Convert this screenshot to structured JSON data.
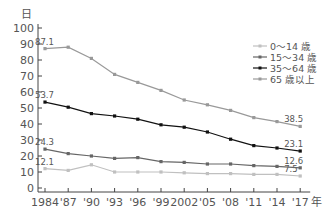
{
  "chart_data": {
    "type": "line",
    "title": "",
    "ylabel": "日",
    "xlabel": "年",
    "ylim": [
      0,
      100
    ],
    "yticks": [
      0,
      10,
      20,
      30,
      40,
      50,
      60,
      70,
      80,
      90,
      100
    ],
    "categories": [
      "1984",
      "'87",
      "'90",
      "'93",
      "'96",
      "'99",
      "2002",
      "'05",
      "'08",
      "'11",
      "'14",
      "'17"
    ],
    "grid": false,
    "legend_position": "upper right",
    "series": [
      {
        "name": "0～14 歳",
        "color": "#c0c0c0",
        "values": [
          12.1,
          11.0,
          14.5,
          10.0,
          10.0,
          10.0,
          9.5,
          9.0,
          9.0,
          8.5,
          8.5,
          7.5
        ],
        "labels": {
          "first": "12.1",
          "last": "7.5"
        }
      },
      {
        "name": "15～34 歳",
        "color": "#666666",
        "values": [
          24.3,
          21.5,
          20.0,
          18.5,
          19.0,
          16.5,
          16.0,
          15.0,
          15.0,
          14.0,
          13.5,
          12.6
        ],
        "labels": {
          "first": "24.3",
          "last": "12.6"
        }
      },
      {
        "name": "35～64 歳",
        "color": "#111111",
        "values": [
          53.7,
          50.5,
          46.5,
          45.0,
          43.0,
          39.5,
          38.0,
          35.0,
          30.5,
          26.5,
          25.0,
          23.1
        ],
        "labels": {
          "first": "53.7",
          "last": "23.1"
        }
      },
      {
        "name": "65 歳以上",
        "color": "#999999",
        "values": [
          87.1,
          88.0,
          81.0,
          71.0,
          66.0,
          61.0,
          55.0,
          52.0,
          48.5,
          44.0,
          41.5,
          38.5
        ],
        "labels": {
          "first": "87.1",
          "last": "38.5"
        }
      }
    ]
  }
}
